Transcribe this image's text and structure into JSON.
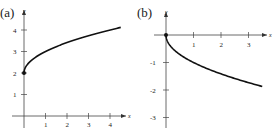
{
  "chart_data": [
    {
      "type": "line",
      "panel_label": "(a)",
      "title": "",
      "xlabel": "x",
      "ylabel": "y",
      "x_ticks": [
        "1",
        "2",
        "3",
        "4"
      ],
      "y_ticks": [
        "1",
        "2",
        "3",
        "4"
      ],
      "xlim": [
        -0.5,
        4.8
      ],
      "ylim": [
        -0.5,
        4.6
      ],
      "grid": false,
      "function": "y = sqrt(x) + 2",
      "start_point": [
        0,
        2
      ],
      "series": [
        {
          "name": "f(x)",
          "x": [
            0,
            0.25,
            0.5,
            1,
            1.5,
            2,
            2.5,
            3,
            3.5,
            4,
            4.5
          ],
          "y": [
            2,
            2.5,
            2.71,
            3,
            3.22,
            3.41,
            3.58,
            3.73,
            3.87,
            4,
            4.12
          ]
        }
      ]
    },
    {
      "type": "line",
      "panel_label": "(b)",
      "title": "",
      "xlabel": "x",
      "ylabel": "y",
      "x_ticks": [
        "1",
        "2",
        "3"
      ],
      "y_ticks": [
        "-1",
        "-2",
        "-3"
      ],
      "xlim": [
        -0.5,
        3.8
      ],
      "ylim": [
        -3.5,
        0.6
      ],
      "grid": false,
      "function": "y = -sqrt(x)",
      "start_point": [
        0,
        0
      ],
      "series": [
        {
          "name": "f(x)",
          "x": [
            0,
            0.25,
            0.5,
            1,
            1.5,
            2,
            2.5,
            3,
            3.5
          ],
          "y": [
            0,
            -0.5,
            -0.71,
            -1,
            -1.22,
            -1.41,
            -1.58,
            -1.73,
            -1.87
          ]
        }
      ]
    }
  ]
}
